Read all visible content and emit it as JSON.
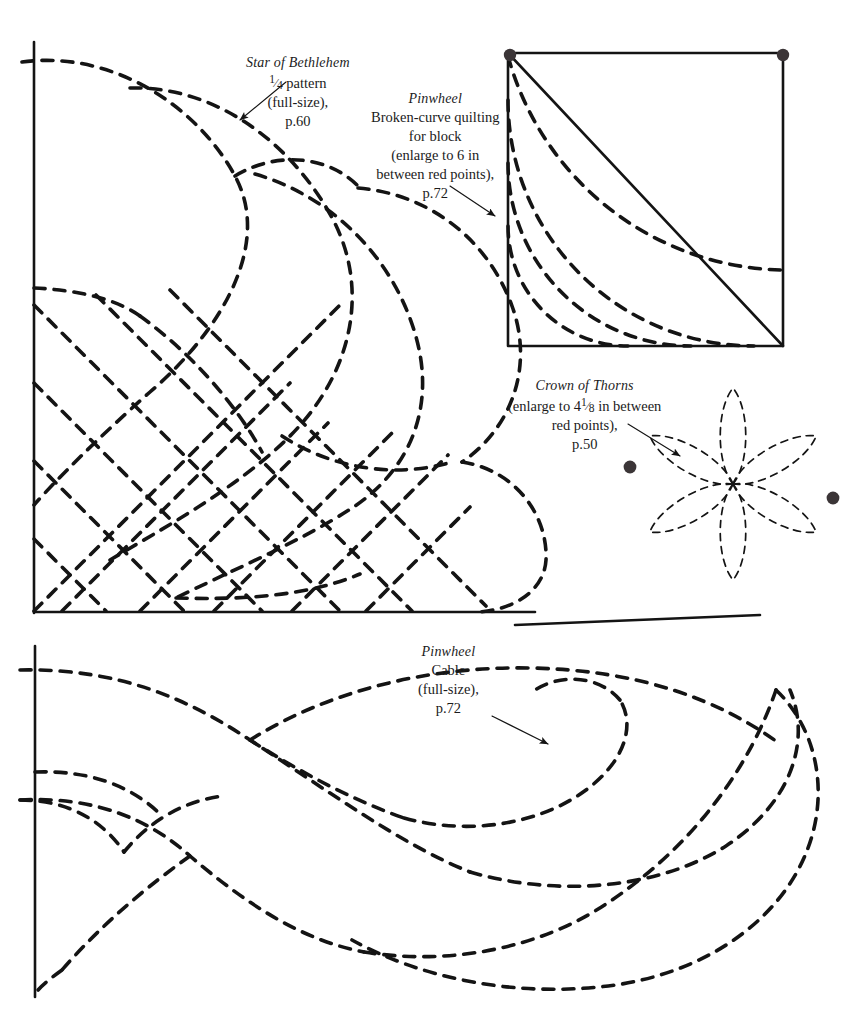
{
  "page": {
    "kind": "quilting-pattern-plate",
    "background": "#ffffff",
    "ink": "#111111",
    "point_color": "#3b3537"
  },
  "labels": {
    "star_of_bethlehem": {
      "title": "Star of Bethlehem",
      "line1_fraction_num": "1",
      "line1_fraction_den": "4",
      "line1_rest": "pattern",
      "line2": "(full-size),",
      "page_ref": "p.60"
    },
    "pinwheel_block": {
      "title": "Pinwheel",
      "line1": "Broken-curve quilting",
      "line2": "for block",
      "line3": "(enlarge to 6 in",
      "line4": "between red points),",
      "page_ref": "p.72"
    },
    "crown_of_thorns": {
      "title": "Crown of Thorns",
      "line1_pre": "(enlarge to 4",
      "line1_frac_num": "1",
      "line1_frac_den": "8",
      "line1_post": "in between",
      "line2": "red points),",
      "page_ref": "p.50"
    },
    "pinwheel_cable": {
      "title": "Pinwheel",
      "line1": "Cable",
      "line2": "(full-size),",
      "page_ref": "p.72"
    }
  },
  "figures": {
    "star_of_bethlehem": {
      "name": "Star of Bethlehem quarter pattern",
      "axis_vertical": {
        "x": 34,
        "y1": 42,
        "y2": 613
      },
      "axis_horizontal": {
        "y": 612,
        "x1": 34,
        "x2": 535
      },
      "origin": [
        34,
        612
      ],
      "style": "dashed-petal-arcs-and-crosshatch"
    },
    "pinwheel_block": {
      "name": "Pinwheel broken-curve block",
      "square": {
        "x": 508,
        "y": 53,
        "w": 275,
        "h": 293
      },
      "diagonal": "top-left to bottom-right",
      "arc_center": "bottom-left corner",
      "arc_radii": [
        120,
        183,
        246,
        308
      ],
      "red_points": [
        [
          510,
          54
        ],
        [
          784,
          54
        ]
      ]
    },
    "crown_of_thorns": {
      "name": "Crown of Thorns petal rosette",
      "center": [
        733,
        484
      ],
      "petals": 6,
      "petal_length": 96,
      "petal_width": 27,
      "red_points": [
        [
          629,
          466
        ],
        [
          833,
          497
        ]
      ]
    },
    "pinwheel_cable": {
      "name": "Pinwheel cable (full-size)",
      "axis_vertical": {
        "x": 35,
        "y1": 646,
        "y2": 997
      },
      "divider_line": {
        "x1": 515,
        "y1": 625,
        "x2": 760,
        "y2": 615
      },
      "style": "interwoven-dashed-cable"
    }
  },
  "dash": {
    "primary": "11 9",
    "thin": "7 6",
    "stroke_width_main": 3.6,
    "stroke_width_thin": 1.7,
    "stroke_width_solid": 2.6
  }
}
